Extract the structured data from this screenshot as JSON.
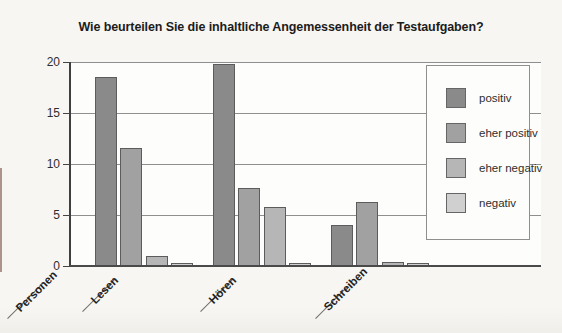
{
  "chart_data": {
    "type": "bar",
    "title": "Wie beurteilen Sie die inhaltliche Angemessenheit der Testaufgaben?",
    "axis_label": "Personen",
    "categories": [
      "Lesen",
      "Hören",
      "Schreiben"
    ],
    "series": [
      {
        "name": "positiv",
        "color": "#8a8a8a",
        "values": [
          18.5,
          19.8,
          4.0
        ]
      },
      {
        "name": "eher positiv",
        "color": "#a1a1a1",
        "values": [
          11.6,
          7.6,
          6.3
        ]
      },
      {
        "name": "eher negativ",
        "color": "#b6b6b6",
        "values": [
          1.0,
          5.8,
          0.4
        ]
      },
      {
        "name": "negativ",
        "color": "#d0d0d0",
        "values": [
          0.3,
          0.3,
          0.3
        ]
      }
    ],
    "ylim": [
      0,
      20
    ],
    "yticks": [
      0,
      5,
      10,
      15,
      20
    ],
    "grid": true,
    "legend_position": "right-overlay",
    "colors": {
      "page_background": "#f8f6f2",
      "plot_background": "#fdfdfc",
      "gridline": "#8f8f8f",
      "axis": "#4a4a4a",
      "text": "#1c1c1c"
    }
  }
}
